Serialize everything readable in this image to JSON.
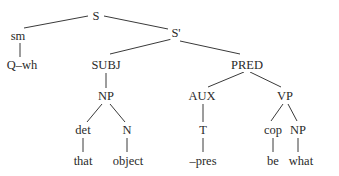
{
  "diagram": {
    "type": "syntax-tree",
    "nodes": {
      "S": {
        "label": "S",
        "x": 96,
        "y": 16
      },
      "sm": {
        "label": "sm",
        "x": 18,
        "y": 36
      },
      "S_prime": {
        "label": "S'",
        "x": 176,
        "y": 33
      },
      "Q_wh": {
        "label": "Q–wh",
        "x": 22,
        "y": 65
      },
      "SUBJ": {
        "label": "SUBJ",
        "x": 106,
        "y": 65
      },
      "PRED": {
        "label": "PRED",
        "x": 247,
        "y": 65
      },
      "NP_subj": {
        "label": "NP",
        "x": 106,
        "y": 96
      },
      "AUX": {
        "label": "AUX",
        "x": 202,
        "y": 96
      },
      "VP": {
        "label": "VP",
        "x": 285,
        "y": 96
      },
      "det": {
        "label": "det",
        "x": 83,
        "y": 130
      },
      "N": {
        "label": "N",
        "x": 127,
        "y": 130
      },
      "T": {
        "label": "T",
        "x": 203,
        "y": 130
      },
      "cop": {
        "label": "cop",
        "x": 273,
        "y": 130
      },
      "NP_obj": {
        "label": "NP",
        "x": 298,
        "y": 130
      },
      "that": {
        "label": "that",
        "x": 83,
        "y": 161
      },
      "object": {
        "label": "object",
        "x": 128,
        "y": 161
      },
      "pres": {
        "label": "–pres",
        "x": 203,
        "y": 161
      },
      "be": {
        "label": "be",
        "x": 273,
        "y": 161
      },
      "what": {
        "label": "what",
        "x": 301,
        "y": 161
      }
    },
    "edges": [
      [
        "S",
        "sm"
      ],
      [
        "S",
        "S_prime"
      ],
      [
        "sm",
        "Q_wh"
      ],
      [
        "S_prime",
        "SUBJ"
      ],
      [
        "S_prime",
        "PRED"
      ],
      [
        "SUBJ",
        "NP_subj"
      ],
      [
        "NP_subj",
        "det"
      ],
      [
        "NP_subj",
        "N"
      ],
      [
        "det",
        "that"
      ],
      [
        "N",
        "object"
      ],
      [
        "PRED",
        "AUX"
      ],
      [
        "PRED",
        "VP"
      ],
      [
        "AUX",
        "T"
      ],
      [
        "T",
        "pres"
      ],
      [
        "VP",
        "cop"
      ],
      [
        "VP",
        "NP_obj"
      ],
      [
        "cop",
        "be"
      ],
      [
        "NP_obj",
        "what"
      ]
    ]
  }
}
